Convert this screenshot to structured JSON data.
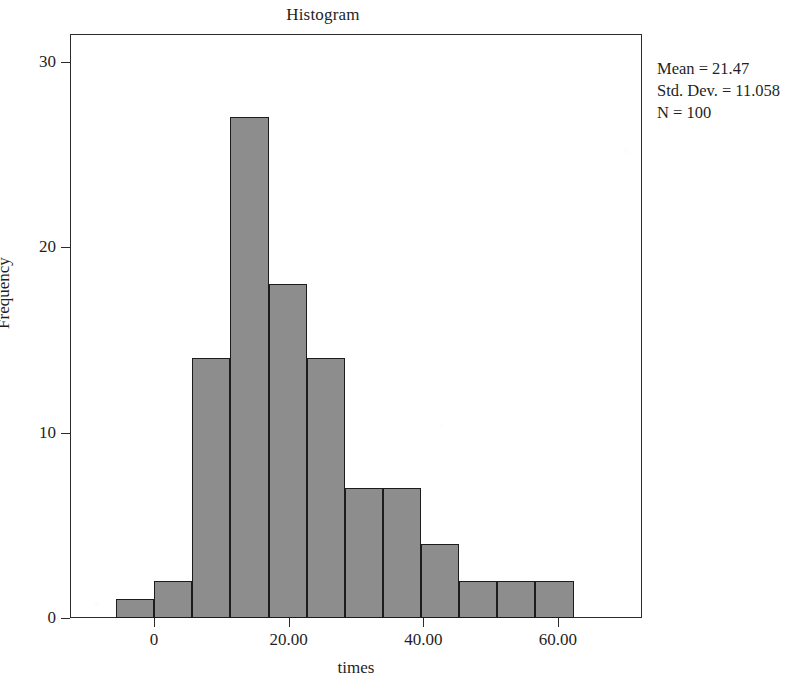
{
  "chart_data": {
    "type": "bar",
    "title": "Histogram",
    "xlabel": "times",
    "ylabel": "Frequency",
    "grid": false,
    "legend": "none",
    "xlim": [
      -12.5,
      72.5
    ],
    "ylim": [
      0,
      31.5
    ],
    "bin_width": 5.67,
    "x_tick_labels": [
      "0",
      "20.00",
      "40.00",
      "60.00"
    ],
    "x_tick_values": [
      0,
      20,
      40,
      60
    ],
    "y_tick_labels": [
      "0",
      "10",
      "20",
      "30"
    ],
    "y_tick_values": [
      0,
      10,
      20,
      30
    ],
    "categories": [
      "-5.67 to 0.00",
      "0.00 to 5.67",
      "5.67 to 11.33",
      "11.33 to 17.00",
      "17.00 to 22.67",
      "22.67 to 28.33",
      "28.33 to 34.00",
      "34.00 to 39.67",
      "39.67 to 45.33",
      "45.33 to 51.00",
      "51.00 to 56.67",
      "56.67 to 62.33"
    ],
    "bin_starts": [
      -5.67,
      0,
      5.67,
      11.33,
      17.0,
      22.67,
      28.33,
      34.0,
      39.67,
      45.33,
      51.0,
      56.67
    ],
    "values": [
      1,
      2,
      14,
      27,
      18,
      14,
      7,
      7,
      4,
      2,
      2,
      2
    ],
    "bar_fill_color": "#8d8d8d",
    "bar_edge_color": "#1c1c1c",
    "axis_color": "#2b2b2b"
  },
  "annotation": {
    "mean_label": "Mean = 21.47",
    "std_dev_label": "Std. Dev. = 11.058",
    "n_label": "N = 100"
  }
}
